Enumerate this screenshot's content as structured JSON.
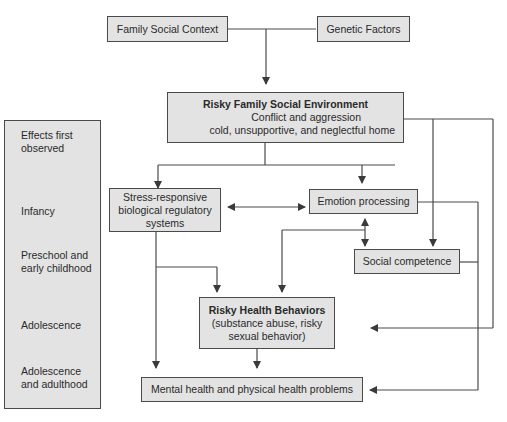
{
  "diagram": {
    "nodes": {
      "family_social_context": "Family Social Context",
      "genetic_factors": "Genetic Factors",
      "risky_family_env": {
        "title": "Risky Family Social Environment",
        "line1": "Conflict and aggression",
        "line2": "cold, unsupportive, and neglectful home"
      },
      "stress_responsive": {
        "line1": "Stress-responsive",
        "line2": "biological regulatory",
        "line3": "systems"
      },
      "emotion_processing": "Emotion processing",
      "social_competence": "Social competence",
      "risky_health": {
        "title": "Risky Health Behaviors",
        "line1": "(substance abuse, risky",
        "line2": "sexual behavior)"
      },
      "health_problems": "Mental health and physical health problems"
    },
    "timeline": {
      "header": "Effects first observed",
      "stages": [
        "Infancy",
        "Preschool and early childhood",
        "Adolescence",
        "Adolescence and adulthood"
      ]
    },
    "colors": {
      "box_fill": "#e3e3e3",
      "line": "#4a4a4a"
    }
  }
}
